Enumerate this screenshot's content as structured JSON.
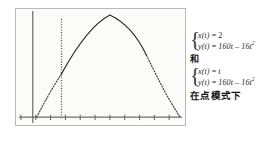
{
  "graph": {
    "name": "parametric-plot",
    "frame": {
      "x": 15,
      "y": 8,
      "width": 171,
      "height": 118
    },
    "background_color": "#fbfbfa",
    "border_color": "#b9b9b9",
    "axis_color": "#3a3a3a",
    "curve_color": "#2b2b2b",
    "xaxis": {
      "y": 110,
      "x_start": 3,
      "x_end": 168,
      "tick_count": 11,
      "tick_height": 5,
      "tick_xs": [
        5,
        20,
        35,
        50,
        65,
        80,
        95,
        110,
        125,
        140,
        155
      ]
    },
    "yaxis": {
      "x": 17,
      "y_top": 2,
      "y_bottom": 116
    },
    "vertical_dotted_line": {
      "label": "x(t) = 2 trace",
      "x": 46,
      "y_top": 10,
      "y_bottom": 110
    },
    "parabola": {
      "label": "y(t) = 160t - 16t^2 trace",
      "x_left": 21,
      "x_right": 166,
      "apex_x": 95,
      "apex_y": 6,
      "baseline_y": 110,
      "solid_from_x": 46,
      "solid_to_x": 132
    }
  },
  "equations": {
    "system_1": {
      "brace": "{",
      "line_1": {
        "lhs": "x(t)",
        "eq": "=",
        "rhs": "2"
      },
      "line_2": {
        "lhs": "y(t)",
        "eq": "=",
        "rhs_a": "160t",
        "minus": "–",
        "rhs_b": "16t",
        "exp": "2"
      }
    },
    "conjunction": "和",
    "system_2": {
      "brace": "{",
      "line_1": {
        "lhs": "x(t)",
        "eq": "=",
        "rhs": "t"
      },
      "line_2": {
        "lhs": "y(t)",
        "eq": "=",
        "rhs_a": "160t",
        "minus": "–",
        "rhs_b": "16t",
        "exp": "2"
      }
    },
    "mode_caption": "在点模式下"
  }
}
